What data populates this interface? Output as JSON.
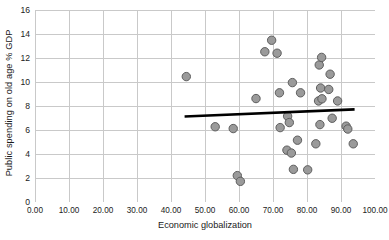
{
  "chart_data": {
    "type": "scatter",
    "title": "",
    "xlabel": "Economic globalization",
    "ylabel": "Public spending on old age % GDP",
    "xlim": [
      0,
      100
    ],
    "ylim": [
      0,
      16
    ],
    "xticks": [
      "0.00",
      "10.00",
      "20.00",
      "30.00",
      "40.00",
      "50.00",
      "60.00",
      "70.00",
      "80.00",
      "90.00",
      "100.00"
    ],
    "xtick_values": [
      0,
      10,
      20,
      30,
      40,
      50,
      60,
      70,
      80,
      90,
      100
    ],
    "yticks": [
      "0",
      "2",
      "4",
      "6",
      "8",
      "10",
      "12",
      "14",
      "16"
    ],
    "ytick_values": [
      0,
      2,
      4,
      6,
      8,
      10,
      12,
      14,
      16
    ],
    "grid": true,
    "legend": "none",
    "marker_fill": "#9a9a9a",
    "marker_stroke": "#5e5e5e",
    "marker_radius": 4.2,
    "gridline_color": "#c9c9c9",
    "trendline_color": "#000000",
    "trendline": {
      "x0": 44.0,
      "y0": 7.12,
      "x1": 94.0,
      "y1": 7.72,
      "width": 2.6
    },
    "points": [
      {
        "x": 44.5,
        "y": 10.45
      },
      {
        "x": 53.0,
        "y": 6.27
      },
      {
        "x": 58.3,
        "y": 6.12
      },
      {
        "x": 59.5,
        "y": 2.2
      },
      {
        "x": 60.4,
        "y": 1.72
      },
      {
        "x": 65.0,
        "y": 8.62
      },
      {
        "x": 67.6,
        "y": 12.52
      },
      {
        "x": 69.6,
        "y": 13.48
      },
      {
        "x": 71.2,
        "y": 12.4
      },
      {
        "x": 71.9,
        "y": 9.1
      },
      {
        "x": 72.1,
        "y": 6.2
      },
      {
        "x": 74.1,
        "y": 4.32
      },
      {
        "x": 74.3,
        "y": 7.15
      },
      {
        "x": 74.8,
        "y": 6.62
      },
      {
        "x": 75.4,
        "y": 4.08
      },
      {
        "x": 75.7,
        "y": 9.95
      },
      {
        "x": 76.0,
        "y": 2.72
      },
      {
        "x": 77.2,
        "y": 5.15
      },
      {
        "x": 78.1,
        "y": 9.1
      },
      {
        "x": 80.2,
        "y": 2.68
      },
      {
        "x": 82.6,
        "y": 4.85
      },
      {
        "x": 83.4,
        "y": 8.42
      },
      {
        "x": 83.6,
        "y": 11.42
      },
      {
        "x": 83.8,
        "y": 6.45
      },
      {
        "x": 84.0,
        "y": 9.5
      },
      {
        "x": 84.3,
        "y": 12.05
      },
      {
        "x": 84.4,
        "y": 8.6
      },
      {
        "x": 86.4,
        "y": 9.38
      },
      {
        "x": 86.8,
        "y": 10.65
      },
      {
        "x": 87.4,
        "y": 6.98
      },
      {
        "x": 89.0,
        "y": 8.42
      },
      {
        "x": 91.5,
        "y": 6.32
      },
      {
        "x": 92.0,
        "y": 6.08
      },
      {
        "x": 93.6,
        "y": 4.85
      }
    ]
  }
}
